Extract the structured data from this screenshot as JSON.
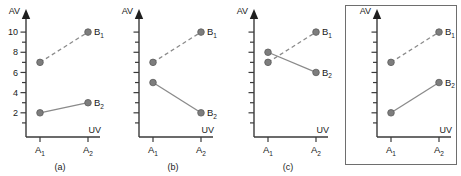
{
  "figure": {
    "axis_labels": {
      "y": "AV",
      "x": "UV"
    },
    "category_labels": [
      "A",
      "A"
    ],
    "category_subscripts": [
      "1",
      "2"
    ],
    "series_labels": [
      "B",
      "B"
    ],
    "series_subscripts": [
      "1",
      "2"
    ],
    "colors": {
      "marker_fill": "#7d7d7d",
      "marker_stroke": "#5c5c5c",
      "line": "#8a8a8a",
      "axis": "#3a3a3a",
      "text": "#1a1a1a",
      "frame": "#6e6e6e"
    }
  },
  "panels": [
    {
      "id": "panel-a",
      "caption": "(a)",
      "boxed": false,
      "show_tick_labels": true,
      "tick_labels": [
        "2",
        "4",
        "6",
        "8",
        "10"
      ]
    },
    {
      "id": "panel-b",
      "caption": "(b)",
      "boxed": false,
      "show_tick_labels": false,
      "tick_labels": []
    },
    {
      "id": "panel-c",
      "caption": "(c)",
      "boxed": false,
      "show_tick_labels": false,
      "tick_labels": []
    },
    {
      "id": "panel-d",
      "caption": "",
      "boxed": true,
      "show_tick_labels": false,
      "tick_labels": []
    }
  ],
  "chart_data": [
    {
      "type": "line",
      "title": "(a)",
      "xlabel": "UV",
      "ylabel": "AV",
      "categories": [
        "A1",
        "A2"
      ],
      "ylim": [
        0,
        11
      ],
      "yticks": [
        2,
        4,
        6,
        8,
        10
      ],
      "grid": false,
      "legend": "inline-right",
      "series": [
        {
          "name": "B1",
          "values": [
            7,
            10
          ],
          "style": "dashed"
        },
        {
          "name": "B2",
          "values": [
            2,
            3
          ],
          "style": "solid"
        }
      ],
      "annotation": "no interaction, parallel lines"
    },
    {
      "type": "line",
      "title": "(b)",
      "xlabel": "UV",
      "ylabel": "AV",
      "categories": [
        "A1",
        "A2"
      ],
      "ylim": [
        0,
        11
      ],
      "yticks": [],
      "grid": false,
      "legend": "inline-right",
      "series": [
        {
          "name": "B1",
          "values": [
            7,
            10
          ],
          "style": "dashed"
        },
        {
          "name": "B2",
          "values": [
            5,
            2
          ],
          "style": "solid"
        }
      ],
      "annotation": "divergent interaction"
    },
    {
      "type": "line",
      "title": "(c)",
      "xlabel": "UV",
      "ylabel": "AV",
      "categories": [
        "A1",
        "A2"
      ],
      "ylim": [
        0,
        11
      ],
      "yticks": [],
      "grid": false,
      "legend": "inline-right",
      "series": [
        {
          "name": "B1",
          "values": [
            7,
            10
          ],
          "style": "dashed"
        },
        {
          "name": "B2",
          "values": [
            8,
            6
          ],
          "style": "solid"
        }
      ],
      "annotation": "crossover interaction"
    },
    {
      "type": "line",
      "title": "",
      "xlabel": "UV",
      "ylabel": "AV",
      "categories": [
        "A1",
        "A2"
      ],
      "ylim": [
        0,
        11
      ],
      "yticks": [],
      "grid": false,
      "legend": "inline-right",
      "series": [
        {
          "name": "B1",
          "values": [
            7,
            10
          ],
          "style": "dashed"
        },
        {
          "name": "B2",
          "values": [
            2,
            5
          ],
          "style": "solid"
        }
      ],
      "annotation": "boxed panel, parallel-like lines"
    }
  ]
}
